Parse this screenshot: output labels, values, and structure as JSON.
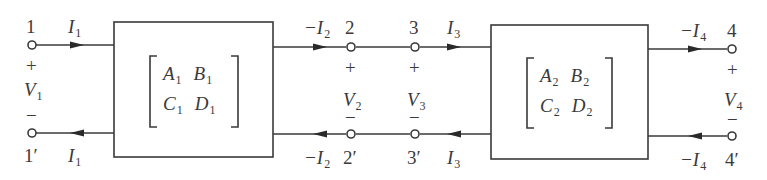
{
  "diagram": {
    "colors": {
      "stroke": "#3a3a3a",
      "background": "#ffffff"
    },
    "ports": {
      "p1": {
        "top": "1",
        "bottom": "1′",
        "voltage": "V",
        "voltage_sub": "1",
        "plus": "+",
        "minus": "−",
        "current_top": "I",
        "current_top_sub": "1",
        "current_bottom": "I",
        "current_bottom_sub": "1"
      },
      "p2": {
        "top": "2",
        "bottom": "2′",
        "voltage": "V",
        "voltage_sub": "2",
        "plus": "+",
        "minus": "−",
        "current_top": "−I",
        "current_top_sub": "2",
        "current_bottom": "−I",
        "current_bottom_sub": "2"
      },
      "p3": {
        "top": "3",
        "bottom": "3′",
        "voltage": "V",
        "voltage_sub": "3",
        "plus": "+",
        "minus": "−",
        "current_top": "I",
        "current_top_sub": "3",
        "current_bottom": "I",
        "current_bottom_sub": "3"
      },
      "p4": {
        "top": "4",
        "bottom": "4′",
        "voltage": "V",
        "voltage_sub": "4",
        "plus": "+",
        "minus": "−",
        "current_top": "−I",
        "current_top_sub": "4",
        "current_bottom": "−I",
        "current_bottom_sub": "4"
      }
    },
    "networks": [
      {
        "name": "network-1",
        "matrix": [
          [
            "A",
            "1",
            "B",
            "1"
          ],
          [
            "C",
            "1",
            "D",
            "1"
          ]
        ]
      },
      {
        "name": "network-2",
        "matrix": [
          [
            "A",
            "2",
            "B",
            "2"
          ],
          [
            "C",
            "2",
            "D",
            "2"
          ]
        ]
      }
    ]
  }
}
